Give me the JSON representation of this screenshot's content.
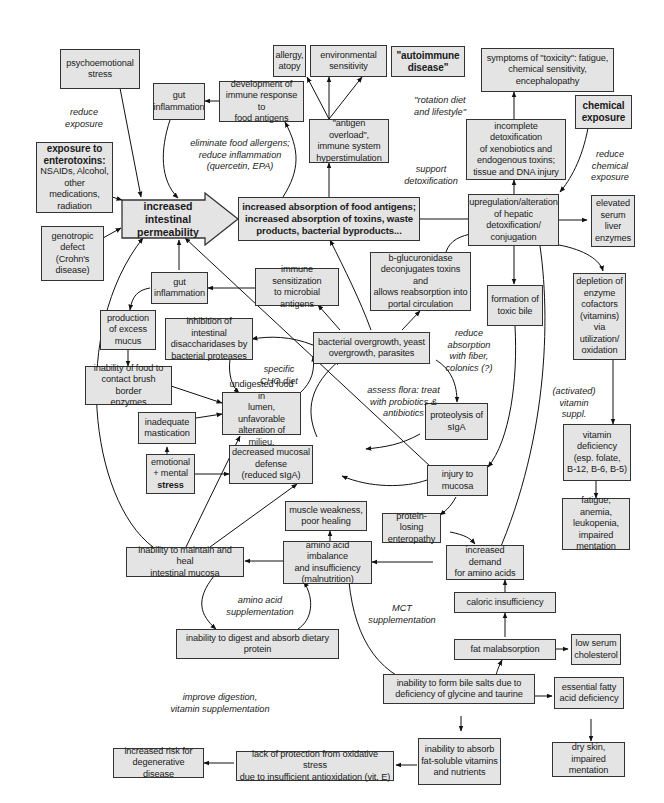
{
  "diagram": {
    "nodes": {
      "psychoemotional_stress": "psychoemotional\nstress",
      "gut_inflammation_top": "gut\ninflammation",
      "immune_response_food": "development of\nimmune response to\nfood antigens",
      "allergy": "allergy,\natopy",
      "environmental_sensitivity": "environmental\nsensitivity",
      "autoimmune_disease": "\"autoimmune\ndisease\"",
      "antigen_overload": "\"antigen overload\",\nimmune system\nhyperstimulation",
      "toxicity_symptoms": "symptoms of \"toxicity\": fatigue,\nchemical sensitivity,\nencephalopathy",
      "chemical_exposure": "chemical\nexposure",
      "incomplete_detox": "incomplete detoxification\nof xenobiotics and\nendogenous toxins;\ntissue and DNA injury",
      "enterotoxins_title": "exposure to\nenterotoxins:",
      "enterotoxins_body": "NSAIDs, Alcohol,\nother medications,\nradiation",
      "genotropic_defect": "genotropic\ndefect\n(Crohn's\ndisease)",
      "intestinal_permeability": "increased intestinal\npermeability",
      "increased_absorption": "increased absorption of food antigens;\nincreased absorption of toxins, waste\nproducts, bacterial byproducts...",
      "hepatic_detox": "upregulation/alteration\nof hepatic\ndetoxification/\nconjugation",
      "elevated_enzymes": "elevated\nserum\nliver\nenzymes",
      "gut_inflammation_mid": "gut\ninflammation",
      "immune_sensitization": "immune sensitization\nto microbial antigens",
      "b_glucuronidase": "b-glucuronidase\ndeconjugates toxins and\nallows reabsorption into\nportal circulation",
      "toxic_bile": "formation of\ntoxic bile",
      "enzyme_depletion": "depletion of\nenzyme\ncofactors\n(vitamins)\nvia\nutilization/\noxidation",
      "excess_mucus": "production\nof excess\nmucus",
      "disaccharidase_inhibition": "inhibition of intestinal\ndisaccharidases by\nbacterial proteases",
      "bacterial_overgrowth": "bacterial overgrowth, yeast\novergrowth, parasites",
      "brush_border": "inability of food to\ncontact brush border\nenzymes",
      "undigested_food": "undigested food in\nlumen, unfavorable\nalteration of milieu.",
      "inadequate_mastication": "inadequate\nmastication",
      "proteolysis_siga": "proteolysis of\nsIgA",
      "vitamin_deficiency": "vitamin\ndeficiency\n(esp. folate,\nB-12, B-6, B-5)",
      "emotional_stress_a": "emotional\n+ mental",
      "emotional_stress_b": "stress",
      "decreased_defense": "decreased mucosal\ndefense\n(reduced sIgA)",
      "injury_mucosa": "injury to\nmucosa",
      "fatigue_anemia": "fatigue, anemia,\nleukopenia,\nimpaired\nmentation",
      "muscle_weakness": "muscle weakness,\npoor healing",
      "protein_losing": "protein-losing\nenteropathy",
      "maintain_mucosa": "inability to maintain and heal\nintestinal mucosa",
      "amino_imbalance": "amino acid imbalance\nand insufficiency\n(malnutrition)",
      "amino_demand": "increased demand\nfor amino acids",
      "caloric_insufficiency": "caloric insufficiency",
      "digest_protein": "inability to digest and absorb dietary\nprotein",
      "fat_malabsorption": "fat malabsorption",
      "low_cholesterol": "low serum\ncholesterol",
      "bile_salts": "inability to form bile salts due to\ndeficiency of glycine and taurine",
      "fatty_acid_deficiency": "essential fatty\nacid deficiency",
      "dry_skin": "dry skin, impaired\nmentation",
      "fat_soluble": "inability to absorb\nfat-soluble vitamins\nand nutrients",
      "oxidative_stress": "lack of protection from oxidative stress\ndue to insufficient antioxidation (vit. E)",
      "degenerative_risk": "increased risk for\ndegenerative disease"
    },
    "notes": {
      "reduce_exposure": "reduce\nexposure",
      "eliminate_allergens": "eliminate food allergens;\nreduce inflammation\n(quercetin, EPA)",
      "rotation_diet": "\"rotation diet\nand lifestyle\"",
      "support_detox": "support\ndetoxification",
      "reduce_chemical": "reduce\nchemical\nexposure",
      "reduce_absorption": "reduce\nabsorption\nwith fiber,\ncolonics (?)",
      "specific_cho": "specific\nCHO diet",
      "assess_flora": "assess flora: treat\nwith probiotics &\nantibiotics",
      "activated_vitamin": "(activated)\nvitamin\nsuppl.",
      "amino_supplementation": "amino acid\nsupplementation",
      "mct_supplementation": "MCT\nsupplementation",
      "improve_digestion": "improve digestion,\nvitamin supplementation"
    },
    "colors": {
      "box_fill": "#e4e4e4",
      "box_border": "#333333",
      "arrow": "#111111",
      "background": "#ffffff"
    }
  }
}
